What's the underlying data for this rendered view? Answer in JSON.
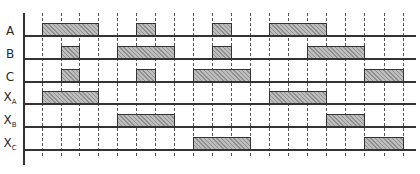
{
  "diagram": {
    "type": "timing-diagram",
    "grid_x": [
      42,
      61,
      79,
      98,
      117,
      136,
      155,
      174,
      193,
      212,
      231,
      250,
      269,
      288,
      307,
      326,
      345,
      364,
      384,
      403
    ],
    "rows": [
      {
        "id": "A",
        "label": "A",
        "sub": "",
        "baseline_y": 36,
        "bars": [
          [
            42,
            98
          ],
          [
            136,
            155
          ],
          [
            212,
            231
          ],
          [
            269,
            326
          ]
        ]
      },
      {
        "id": "B",
        "label": "B",
        "sub": "",
        "baseline_y": 59,
        "bars": [
          [
            61,
            79
          ],
          [
            117,
            174
          ],
          [
            212,
            231
          ],
          [
            307,
            364
          ]
        ]
      },
      {
        "id": "C",
        "label": "C",
        "sub": "",
        "baseline_y": 82,
        "bars": [
          [
            61,
            79
          ],
          [
            136,
            155
          ],
          [
            193,
            250
          ],
          [
            364,
            403
          ]
        ]
      },
      {
        "id": "XA",
        "label": "X",
        "sub": "A",
        "baseline_y": 104,
        "bars": [
          [
            42,
            98
          ],
          [
            269,
            326
          ]
        ]
      },
      {
        "id": "XB",
        "label": "X",
        "sub": "B",
        "baseline_y": 127,
        "bars": [
          [
            117,
            174
          ],
          [
            326,
            364
          ]
        ]
      },
      {
        "id": "XC",
        "label": "X",
        "sub": "C",
        "baseline_y": 150,
        "bars": [
          [
            193,
            250
          ],
          [
            364,
            403
          ]
        ]
      }
    ],
    "bar_height": 13,
    "axis": {
      "x": 23,
      "y_top": 13,
      "y_bottom": 165
    },
    "line_end_x": 416,
    "grid_y_top": 13,
    "grid_y_bottom": 156,
    "colors": {
      "line": "#333333",
      "bar_fill": "#bdbdbd",
      "hatch": "#8f8f8f"
    }
  }
}
